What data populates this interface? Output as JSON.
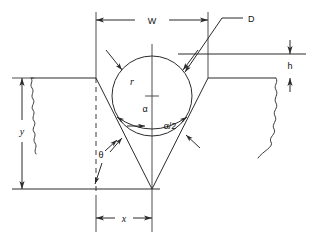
{
  "figure": {
    "type": "engineering-dimension-diagram",
    "background_color": "#ffffff",
    "line_color": "#2b2b2b"
  },
  "labels": {
    "width_top": "W",
    "ball_diameter": "D",
    "ball_radius": "r",
    "included_angle": "α",
    "half_angle": "α/2",
    "wall_angle": "θ",
    "depth": "y",
    "ball_protrusion": "h",
    "half_width_bottom": "x"
  },
  "dimensions": [
    {
      "name": "W",
      "label": "W",
      "orientation": "horizontal",
      "position": "top",
      "arrows": "both-ends"
    },
    {
      "name": "D",
      "label": "D",
      "orientation": "leader",
      "position": "top-right",
      "arrows": "pointer-to-circle"
    },
    {
      "name": "h",
      "label": "h",
      "orientation": "vertical",
      "position": "right",
      "arrows": "both-ends"
    },
    {
      "name": "y",
      "label": "y",
      "orientation": "vertical",
      "position": "left",
      "arrows": "both-ends"
    },
    {
      "name": "x",
      "label": "x",
      "orientation": "horizontal",
      "position": "bottom",
      "arrows": "both-ends"
    },
    {
      "name": "r",
      "label": "r",
      "orientation": "radius",
      "position": "inside-circle",
      "arrows": "none"
    },
    {
      "name": "alpha",
      "label": "α",
      "orientation": "angle",
      "position": "circle-center",
      "arrows": "none"
    },
    {
      "name": "alpha-half",
      "label": "α/2",
      "orientation": "angle",
      "position": "right-of-centerline",
      "arrows": "arc-both-ends"
    },
    {
      "name": "theta",
      "label": "θ",
      "orientation": "angle",
      "position": "lower-left",
      "arrows": "two-leaders"
    }
  ],
  "geometry": {
    "circle_center": {
      "x": 152,
      "y": 96
    },
    "circle_radius": 40,
    "apex": {
      "x": 152,
      "y": 189
    },
    "baseline_y": 189,
    "workpiece_top_y": 78,
    "upper_reference_y": 54,
    "groove_left_top_x": 96,
    "groove_right_top_x": 208
  }
}
